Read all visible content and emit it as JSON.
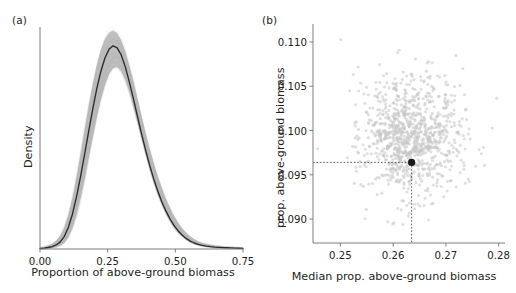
{
  "figure": {
    "width": 516,
    "height": 293,
    "background": "#ffffff",
    "axis_color": "#7f7f7f",
    "curve_color": "#2b2b2b",
    "band_color": "#b3b3b3",
    "point_color": "#1a1a1a",
    "guide_color": "#4d4d4d"
  },
  "panels": [
    {
      "id": "a",
      "label": "(a)",
      "chart_ref": 0
    },
    {
      "id": "b",
      "label": "(b)",
      "chart_ref": 1
    }
  ],
  "chart_data": [
    {
      "type": "line",
      "panel": "(a)",
      "title": "",
      "xlabel": "Proportion of above-ground biomass",
      "ylabel": "Density",
      "xlim": [
        0.0,
        0.75
      ],
      "ylim": [
        0.0,
        4.35
      ],
      "grid": false,
      "legend": null,
      "xticks": [
        0.0,
        0.25,
        0.5,
        0.75
      ],
      "xticklabels": [
        "0.00",
        "0.25",
        "0.50",
        "0.75"
      ],
      "yticks": [],
      "yticklabels": [],
      "spines": [
        "left",
        "bottom"
      ],
      "series": [
        {
          "name": "mean kernel density",
          "style": "solid-line",
          "color": "#2b2b2b",
          "x": [
            0.0,
            0.015,
            0.03,
            0.045,
            0.06,
            0.075,
            0.09,
            0.105,
            0.12,
            0.135,
            0.15,
            0.165,
            0.18,
            0.195,
            0.21,
            0.225,
            0.24,
            0.255,
            0.27,
            0.285,
            0.3,
            0.315,
            0.33,
            0.345,
            0.36,
            0.375,
            0.39,
            0.405,
            0.42,
            0.435,
            0.45,
            0.465,
            0.48,
            0.495,
            0.51,
            0.525,
            0.54,
            0.555,
            0.57,
            0.585,
            0.6,
            0.615,
            0.63,
            0.645,
            0.66,
            0.675,
            0.69,
            0.705,
            0.72,
            0.735,
            0.75
          ],
          "y": [
            0.01,
            0.018,
            0.03,
            0.048,
            0.08,
            0.14,
            0.25,
            0.43,
            0.69,
            1.03,
            1.43,
            1.87,
            2.32,
            2.76,
            3.16,
            3.5,
            3.76,
            3.93,
            4.0,
            3.96,
            3.82,
            3.59,
            3.29,
            2.96,
            2.61,
            2.27,
            1.95,
            1.65,
            1.38,
            1.14,
            0.93,
            0.75,
            0.595,
            0.465,
            0.36,
            0.275,
            0.208,
            0.156,
            0.118,
            0.09,
            0.07,
            0.056,
            0.046,
            0.038,
            0.032,
            0.028,
            0.024,
            0.021,
            0.018,
            0.015,
            0.012
          ]
        },
        {
          "name": "bootstrap replicate envelope (upper)",
          "style": "band-edge",
          "color": "#b3b3b3",
          "x": [
            0.0,
            0.015,
            0.03,
            0.045,
            0.06,
            0.075,
            0.09,
            0.105,
            0.12,
            0.135,
            0.15,
            0.165,
            0.18,
            0.195,
            0.21,
            0.225,
            0.24,
            0.255,
            0.27,
            0.285,
            0.3,
            0.315,
            0.33,
            0.345,
            0.36,
            0.375,
            0.39,
            0.405,
            0.42,
            0.435,
            0.45,
            0.465,
            0.48,
            0.495,
            0.51,
            0.525,
            0.54,
            0.555,
            0.57,
            0.585,
            0.6,
            0.615,
            0.63,
            0.645,
            0.66,
            0.675,
            0.69,
            0.705,
            0.72,
            0.735,
            0.75
          ],
          "y": [
            0.03,
            0.045,
            0.07,
            0.105,
            0.165,
            0.265,
            0.43,
            0.68,
            1.01,
            1.42,
            1.88,
            2.36,
            2.83,
            3.26,
            3.63,
            3.93,
            4.14,
            4.26,
            4.3,
            4.25,
            4.11,
            3.89,
            3.61,
            3.3,
            2.96,
            2.62,
            2.29,
            1.98,
            1.69,
            1.43,
            1.2,
            0.99,
            0.81,
            0.65,
            0.52,
            0.41,
            0.32,
            0.248,
            0.192,
            0.15,
            0.12,
            0.098,
            0.082,
            0.07,
            0.06,
            0.052,
            0.046,
            0.04,
            0.035,
            0.03,
            0.026
          ]
        },
        {
          "name": "bootstrap replicate envelope (lower)",
          "style": "band-edge",
          "color": "#b3b3b3",
          "x": [
            0.0,
            0.015,
            0.03,
            0.045,
            0.06,
            0.075,
            0.09,
            0.105,
            0.12,
            0.135,
            0.15,
            0.165,
            0.18,
            0.195,
            0.21,
            0.225,
            0.24,
            0.255,
            0.27,
            0.285,
            0.3,
            0.315,
            0.33,
            0.345,
            0.36,
            0.375,
            0.39,
            0.405,
            0.42,
            0.435,
            0.45,
            0.465,
            0.48,
            0.495,
            0.51,
            0.525,
            0.54,
            0.555,
            0.57,
            0.585,
            0.6,
            0.615,
            0.63,
            0.645,
            0.66,
            0.675,
            0.69,
            0.705,
            0.72,
            0.735,
            0.75
          ],
          "y": [
            0.0,
            0.004,
            0.01,
            0.018,
            0.033,
            0.062,
            0.12,
            0.23,
            0.41,
            0.67,
            1.0,
            1.38,
            1.79,
            2.2,
            2.59,
            2.94,
            3.23,
            3.44,
            3.56,
            3.58,
            3.5,
            3.33,
            3.09,
            2.8,
            2.49,
            2.17,
            1.86,
            1.57,
            1.31,
            1.07,
            0.87,
            0.695,
            0.545,
            0.42,
            0.32,
            0.24,
            0.178,
            0.13,
            0.095,
            0.07,
            0.052,
            0.039,
            0.03,
            0.023,
            0.018,
            0.014,
            0.011,
            0.009,
            0.007,
            0.005,
            0.004
          ]
        }
      ],
      "annotations": []
    },
    {
      "type": "scatter",
      "panel": "(b)",
      "title": "",
      "xlabel": "Median prop. above-ground biomass",
      "ylabel": "prop. above-ground biomass",
      "xlim": [
        0.2448,
        0.2812
      ],
      "ylim": [
        0.0873,
        0.1118
      ],
      "grid": false,
      "legend": null,
      "xticks": [
        0.25,
        0.26,
        0.27,
        0.28
      ],
      "xticklabels": [
        "0.25",
        "0.26",
        "0.27",
        "0.28"
      ],
      "yticks": [
        0.09,
        0.095,
        0.1,
        0.105,
        0.11
      ],
      "yticklabels": [
        "0.090",
        "0.095",
        "0.100",
        "0.105",
        "0.110"
      ],
      "spines": [
        "left",
        "bottom"
      ],
      "cloud": {
        "name": "bootstrap replicates",
        "color": "#c4c4c4",
        "n_points": 1000,
        "marker": "circle",
        "marker_size_px": 3.1,
        "opacity": 0.55,
        "center_x": 0.2635,
        "center_y": 0.09935,
        "sd_x": 0.00455,
        "sd_y": 0.00345,
        "correlation": 0.0
      },
      "highlight_point": {
        "name": "observed estimate",
        "x": 0.2635,
        "y": 0.0964,
        "color": "#1a1a1a",
        "radius_px": 3.6
      },
      "guides": [
        {
          "name": "horizontal-reference-line",
          "orientation": "horizontal",
          "value": 0.0964,
          "style": "dotted"
        },
        {
          "name": "vertical-reference-line",
          "orientation": "vertical",
          "value": 0.2635,
          "style": "dotted"
        }
      ],
      "annotations": []
    }
  ]
}
